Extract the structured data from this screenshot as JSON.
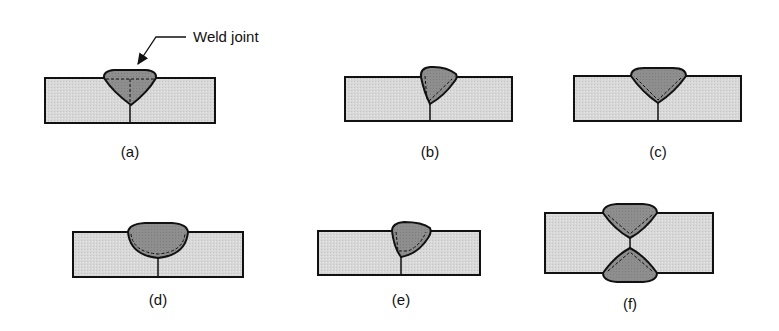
{
  "callout": {
    "text": "Weld joint"
  },
  "colors": {
    "plate_fill": "#d6d6d6",
    "weld_fill": "#8e8e8e",
    "outline": "#111111",
    "background": "#ffffff"
  },
  "panels": [
    {
      "id": "a",
      "label": "(a)",
      "description": "Single-V groove weld, full bead on top, plate butt joint"
    },
    {
      "id": "b",
      "label": "(b)",
      "description": "Single-bevel groove weld"
    },
    {
      "id": "c",
      "label": "(c)",
      "description": "Single-V groove weld with dashed fusion line"
    },
    {
      "id": "d",
      "label": "(d)",
      "description": "Single-U groove weld"
    },
    {
      "id": "e",
      "label": "(e)",
      "description": "Single-J groove weld"
    },
    {
      "id": "f",
      "label": "(f)",
      "description": "Double-V groove weld"
    }
  ]
}
